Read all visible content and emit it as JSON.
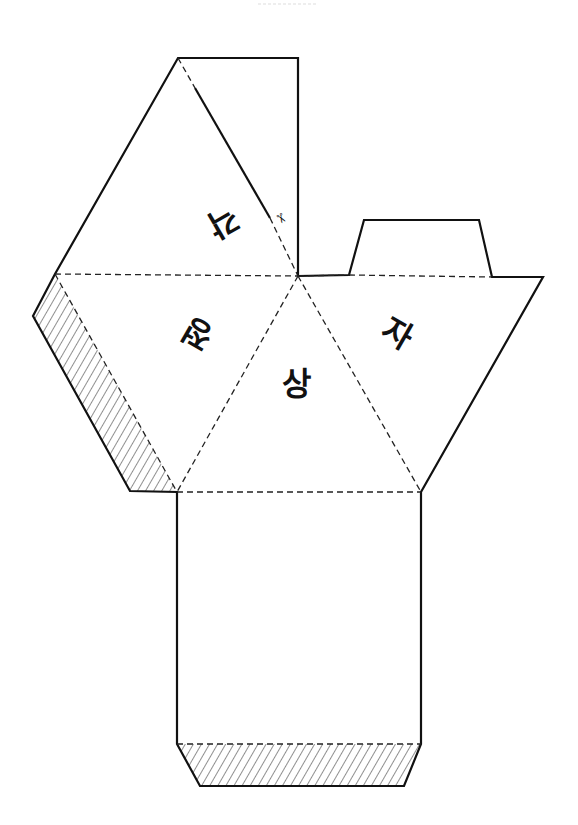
{
  "diagram": {
    "title": "",
    "type": "paper-net-cutout",
    "colors": {
      "line": "#111111",
      "background": "#ffffff",
      "hatch": "#222222"
    },
    "labels": [
      {
        "id": "top",
        "text": "각",
        "rotation_deg": 150
      },
      {
        "id": "left",
        "text": "정",
        "rotation_deg": 210
      },
      {
        "id": "center",
        "text": "상",
        "rotation_deg": 0
      },
      {
        "id": "right",
        "text": "자",
        "rotation_deg": 30
      }
    ],
    "icons": [
      {
        "name": "scissors-icon",
        "glyph": "✂"
      }
    ],
    "legend": {
      "solid_line": "cut line",
      "dashed_line": "fold line",
      "hatched": "glue flap"
    }
  }
}
